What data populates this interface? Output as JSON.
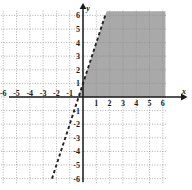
{
  "chart_data": {
    "type": "line",
    "title": "",
    "xlabel": "x",
    "ylabel": "y",
    "xlim": [
      -6.6,
      6.6
    ],
    "ylim": [
      -6.6,
      6.6
    ],
    "grid": true,
    "grid_style": "dotted",
    "grid_spacing": 1,
    "legend": "none",
    "xticks": [
      -6,
      -5,
      -4,
      -3,
      -2,
      -1,
      1,
      2,
      3,
      4,
      5,
      6
    ],
    "yticks": [
      6,
      5,
      4,
      3,
      2,
      1,
      -1,
      -2,
      -3,
      -4,
      -5,
      -6
    ],
    "xtick_labels": [
      "-6",
      "-5",
      "-4",
      "-3",
      "-2",
      "-1",
      "1",
      "2",
      "3",
      "4",
      "5",
      "6"
    ],
    "ytick_labels": [
      "6",
      "5",
      "4",
      "3",
      "2",
      "1",
      "-1",
      "-2",
      "-3",
      "-4",
      "-5",
      "-6"
    ],
    "series": [
      {
        "name": "boundary-line",
        "style": "dashed",
        "color": "#222222",
        "slope": 3,
        "intercept": 1,
        "equation": "y = 3x + 1",
        "x": [
          -2.33,
          1.67
        ],
        "y": [
          -6,
          6
        ],
        "endpoints": [
          [
            -2.33,
            -6
          ],
          [
            1.67,
            6
          ]
        ]
      }
    ],
    "shaded_regions": [
      {
        "name": "solution-region",
        "description": "region right of the dashed line and above the x-axis",
        "color": "#a9a9a9",
        "opacity": 1,
        "bounds": {
          "left": "y = 3x + 1",
          "bottom": "y = 0",
          "right": "x = 6.2",
          "top": "y = 6.3"
        },
        "vertices": [
          [
            -0.33,
            0
          ],
          [
            1.77,
            6.3
          ],
          [
            6.2,
            6.3
          ],
          [
            6.2,
            0
          ]
        ]
      }
    ],
    "axis_arrows": [
      "x-positive",
      "y-positive"
    ],
    "origin_label": ""
  },
  "axes": {
    "x_axis_label": "x",
    "y_axis_label": "y"
  },
  "colors": {
    "background": "#ffffff",
    "axis": "#1a1a1a",
    "grid": "#8c8c8c",
    "line": "#222222",
    "shading": "#a9a9a9"
  }
}
